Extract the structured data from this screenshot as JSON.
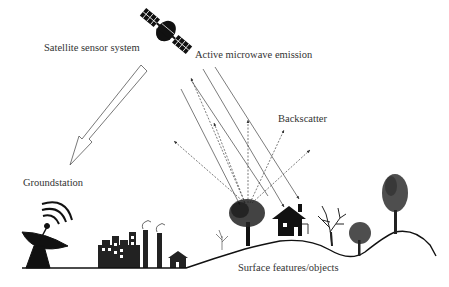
{
  "diagram": {
    "type": "remote-sensing-schematic",
    "labels": {
      "satellite": "Satellite sensor system",
      "emission": "Active microwave emission",
      "backscatter": "Backscatter",
      "groundstation": "Groundstation",
      "surface": "Surface features/objects"
    },
    "icons": [
      "satellite-icon",
      "satellite-dish-icon",
      "factory-icon",
      "house-icon",
      "tree-icon"
    ],
    "colors": {
      "ink": "#1a1a1a",
      "text": "#333333",
      "background": "#ffffff"
    }
  }
}
